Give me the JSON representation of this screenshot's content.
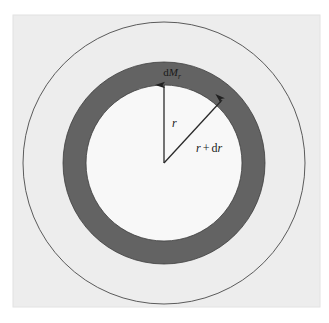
{
  "figure": {
    "name": "spherical-shell-mass-diagram",
    "canvas": {
      "width": 329,
      "height": 323,
      "background": "#ffffff"
    },
    "panel": {
      "x": 13,
      "y": 15,
      "width": 307,
      "height": 292,
      "fill": "#ededed",
      "stroke": "#e2e2e2"
    },
    "center": {
      "x": 164,
      "y": 163
    },
    "circles": {
      "outer_boundary": {
        "label": "outer-sphere-boundary",
        "radius": 141,
        "fill": "none",
        "stroke": "#4a4a4a",
        "stroke_width": 0.9
      },
      "shell_outer": {
        "label": "shell-outer-edge",
        "radius": 101,
        "fill": "#636363",
        "stroke": "#3d3d3d",
        "stroke_width": 0.8
      },
      "shell_inner": {
        "label": "shell-inner-edge",
        "radius": 78,
        "fill": "#f8f8f8",
        "stroke": "#3d3d3d",
        "stroke_width": 0.8
      }
    },
    "arrows": {
      "r_arrow": {
        "name": "radius-r-arrow",
        "from": {
          "x": 164,
          "y": 163
        },
        "to": {
          "x": 164,
          "y": 85
        },
        "color": "#2a2a2a"
      },
      "r_plus_dr_arrow": {
        "name": "radius-r-plus-dr-arrow",
        "from": {
          "x": 164,
          "y": 163
        },
        "to": {
          "x": 222,
          "y": 100
        },
        "color": "#2a2a2a"
      }
    },
    "labels": {
      "shell_mass": {
        "name": "shell-mass-label",
        "base": "d",
        "variable": "M",
        "subscript": "r",
        "x": 172,
        "y": 76,
        "font_size": 11
      },
      "radius_r": {
        "name": "radius-r-label",
        "text": "r",
        "x": 172,
        "y": 127,
        "font_size": 12
      },
      "radius_r_plus_dr": {
        "name": "radius-r-plus-dr-label",
        "part1": "r",
        "operator": "+",
        "part2_upright": "d",
        "part2_italic": "r",
        "x": 196,
        "y": 152,
        "font_size": 12
      }
    }
  },
  "chart_data": {
    "type": "diagram",
    "title": "",
    "elements": [
      {
        "kind": "circle",
        "role": "outer boundary of star",
        "radius": 141,
        "filled": false
      },
      {
        "kind": "annulus",
        "role": "mass shell dM_r",
        "outer_radius": 101,
        "inner_radius": 78,
        "filled": true,
        "fill": "#636363"
      },
      {
        "kind": "arrow",
        "role": "r",
        "length": 78,
        "angle_deg": 90
      },
      {
        "kind": "arrow",
        "role": "r + dr",
        "length": 86,
        "angle_deg": 47
      }
    ],
    "annotations": [
      "dM_r",
      "r",
      "r + dr"
    ],
    "legend": "none",
    "grid": false
  }
}
